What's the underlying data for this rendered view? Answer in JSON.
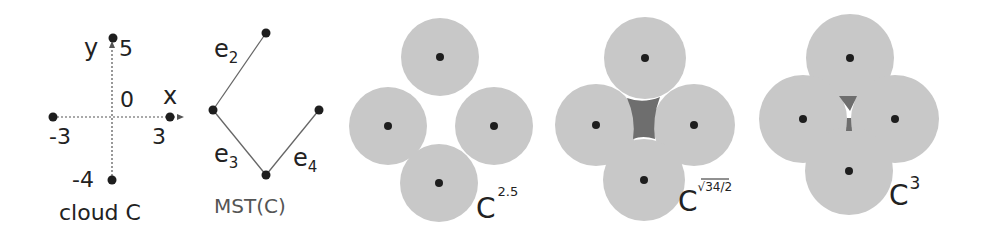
{
  "colors": {
    "background": "#ffffff",
    "disk_fill": "#c8c8c8",
    "hole_fill": "#6e6e6e",
    "point": "#1e1e1e",
    "axis": "#555555",
    "edge": "#555555",
    "label": "#222222",
    "mst_label": "#555555"
  },
  "cloud": {
    "caption": "cloud C",
    "axis_x_label": "x",
    "axis_y_label": "y",
    "origin_label": "0",
    "tick_labels": {
      "y_top": "5",
      "y_bottom": "-4",
      "x_left": "-3",
      "x_right": "3"
    },
    "points": [
      {
        "x": -3,
        "y": 0
      },
      {
        "x": 3,
        "y": 0
      },
      {
        "x": 0,
        "y": 5
      },
      {
        "x": 0,
        "y": -4
      }
    ]
  },
  "mst": {
    "caption": "MST(C)",
    "edges": [
      {
        "label": "e",
        "sub": "2"
      },
      {
        "label": "e",
        "sub": "3"
      },
      {
        "label": "e",
        "sub": "4"
      }
    ]
  },
  "offsets": [
    {
      "base": "C",
      "sup": "2.5"
    },
    {
      "base": "C",
      "sup": "√34/2"
    },
    {
      "base": "C",
      "sup": "3"
    }
  ]
}
